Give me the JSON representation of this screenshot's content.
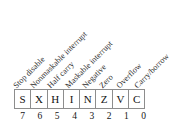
{
  "diagram": {
    "name": "cpu-condition-code-register",
    "bit_count": 8,
    "colors": {
      "background": "#ffffff",
      "box_border": "#8d8d8d",
      "text": "#1a1a1a",
      "label_text": "#2b2b2b"
    },
    "label_rotation_deg": -45,
    "bits": [
      {
        "mnemonic": "S",
        "index": "7",
        "label": "Stop disable"
      },
      {
        "mnemonic": "X",
        "index": "6",
        "label": "Nonmaskable interrupt"
      },
      {
        "mnemonic": "H",
        "index": "5",
        "label": "Half carry"
      },
      {
        "mnemonic": "I",
        "index": "4",
        "label": "Maskable interrupt"
      },
      {
        "mnemonic": "N",
        "index": "3",
        "label": "Negative"
      },
      {
        "mnemonic": "Z",
        "index": "2",
        "label": "Zero"
      },
      {
        "mnemonic": "V",
        "index": "1",
        "label": "Overflow"
      },
      {
        "mnemonic": "C",
        "index": "0",
        "label": "Carry/borrow"
      }
    ]
  }
}
